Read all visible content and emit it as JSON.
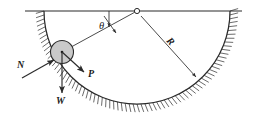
{
  "figure": {
    "background_color": "#ffffff",
    "line_color": "#2b2b2b",
    "hatch_color": "#3a3a3a",
    "ball_fill_color": "#c9c9c9",
    "ball_stroke_color": "#2b2b2b"
  },
  "labels": {
    "angle": "θ",
    "radius": "R",
    "normal_force": "N",
    "weight": "W",
    "applied_force": "P"
  },
  "geometry": {
    "pivot": {
      "x": 137,
      "y": 11,
      "marker": "open-circle",
      "radius_px": 2.6
    },
    "arc": {
      "center_x": 137,
      "center_y": 11,
      "radius": 93,
      "start_deg": 180,
      "end_deg": 360
    },
    "ground_line": {
      "x1": 25,
      "y1": 11,
      "x2": 242,
      "y2": 11
    },
    "ball": {
      "center_x": 62,
      "center_y": 52,
      "radius": 11.5
    },
    "angle_value_deg": 26,
    "hatch_side": "outside"
  },
  "vectors": {
    "normal": {
      "label": "N",
      "from_x": 22,
      "from_y": 78,
      "to_x": 54,
      "to_y": 60,
      "label_x": 19,
      "label_y": 66
    },
    "weight": {
      "label": "W",
      "from_x": 62,
      "from_y": 52,
      "to_x": 62,
      "to_y": 93,
      "label_x": 57,
      "label_y": 103
    },
    "applied": {
      "label": "P",
      "from_x": 62,
      "from_y": 52,
      "to_x": 84,
      "to_y": 72,
      "label_x": 88,
      "label_y": 76
    },
    "radius_arrow": {
      "label": "R",
      "from_x": 141,
      "from_y": 16,
      "to_x": 196,
      "to_y": 77,
      "label_x": 166,
      "label_y": 41
    }
  }
}
